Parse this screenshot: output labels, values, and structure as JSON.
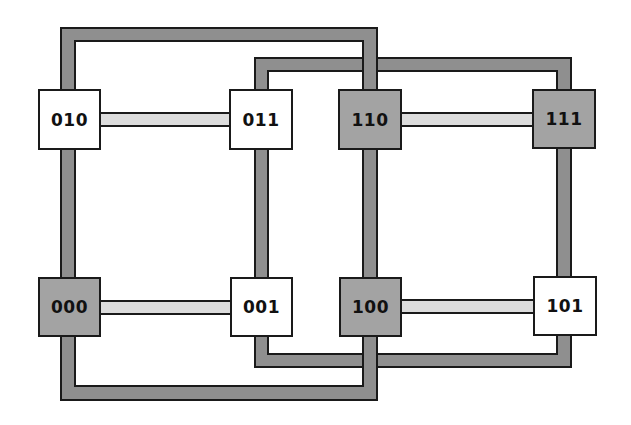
{
  "diagram": {
    "type": "3-dimensional hypercube (cube) network topology",
    "colors": {
      "background": "#ffffff",
      "outline": "#1a1a1a",
      "dim_link_fill": "#8f8f8f",
      "horizontal_link_fill": "#dcdcdc",
      "shaded_node_fill": "#a3a3a3",
      "plain_node_fill": "#ffffff"
    },
    "nodes": [
      {
        "id": "010",
        "label": "010",
        "shade": "light",
        "x": 38,
        "y": 89,
        "w": 63,
        "h": 61
      },
      {
        "id": "011",
        "label": "011",
        "shade": "light",
        "x": 229,
        "y": 89,
        "w": 64,
        "h": 61
      },
      {
        "id": "110",
        "label": "110",
        "shade": "dark",
        "x": 338,
        "y": 89,
        "w": 64,
        "h": 61
      },
      {
        "id": "111",
        "label": "111",
        "shade": "dark",
        "x": 532,
        "y": 89,
        "w": 64,
        "h": 60
      },
      {
        "id": "000",
        "label": "000",
        "shade": "dark",
        "x": 38,
        "y": 277,
        "w": 63,
        "h": 60
      },
      {
        "id": "001",
        "label": "001",
        "shade": "light",
        "x": 230,
        "y": 277,
        "w": 63,
        "h": 60
      },
      {
        "id": "100",
        "label": "100",
        "shade": "dark",
        "x": 339,
        "y": 277,
        "w": 63,
        "h": 60
      },
      {
        "id": "101",
        "label": "101",
        "shade": "light",
        "x": 533,
        "y": 276,
        "w": 64,
        "h": 60
      }
    ],
    "edges": [
      {
        "from": "010",
        "to": "011",
        "style": "horizontal-light"
      },
      {
        "from": "110",
        "to": "111",
        "style": "horizontal-light"
      },
      {
        "from": "000",
        "to": "001",
        "style": "horizontal-light"
      },
      {
        "from": "100",
        "to": "101",
        "style": "horizontal-light"
      },
      {
        "from": "010",
        "to": "000",
        "style": "vertical-dark"
      },
      {
        "from": "011",
        "to": "001",
        "style": "vertical-dark"
      },
      {
        "from": "110",
        "to": "100",
        "style": "vertical-dark"
      },
      {
        "from": "111",
        "to": "101",
        "style": "vertical-dark"
      },
      {
        "from": "010",
        "to": "110",
        "style": "loop-dark",
        "route": "over-top"
      },
      {
        "from": "000",
        "to": "100",
        "style": "loop-dark",
        "route": "under-bottom"
      },
      {
        "from": "011",
        "to": "111",
        "style": "loop-dark",
        "route": "over-top"
      },
      {
        "from": "001",
        "to": "101",
        "style": "loop-dark",
        "route": "under-bottom"
      }
    ]
  }
}
